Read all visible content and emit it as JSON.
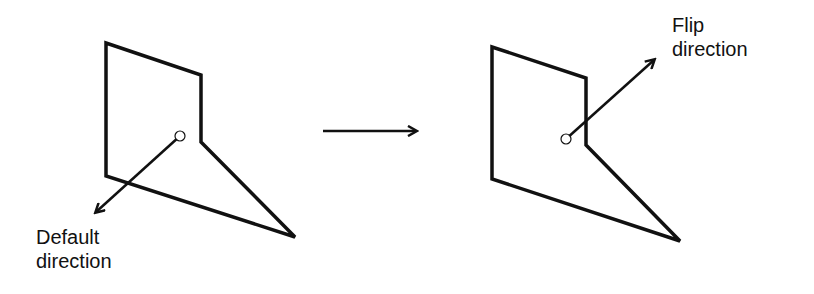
{
  "diagram": {
    "type": "before-after",
    "stroke_color": "#111111",
    "background": "#ffffff",
    "left_panel": {
      "label_line1": "Default",
      "label_line2": "direction",
      "shape_points": "106,43 201,75 201,142 295,237 106,176",
      "origin": {
        "cx": 180,
        "cy": 136,
        "r": 5
      },
      "vector": {
        "x1": 180,
        "y1": 136,
        "x2": 96,
        "y2": 212
      }
    },
    "transition_arrow": {
      "x1": 323,
      "y1": 131,
      "x2": 416,
      "y2": 131
    },
    "right_panel": {
      "label_line1": "Flip",
      "label_line2": "direction",
      "shape_points": "492,47 586,78 586,145 680,241 492,179",
      "origin": {
        "cx": 566,
        "cy": 139,
        "r": 5
      },
      "vector": {
        "x1": 566,
        "y1": 139,
        "x2": 654,
        "y2": 60
      }
    }
  }
}
